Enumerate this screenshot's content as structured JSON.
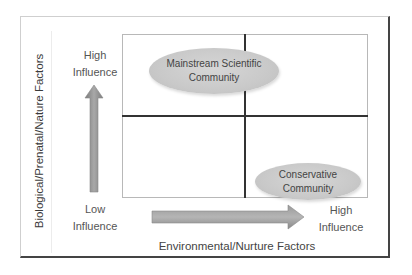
{
  "diagram": {
    "type": "2x2 quadrant matrix",
    "y_axis": {
      "title": "Biological/Prenatal/Nature Factors",
      "high_label": [
        "High",
        "Influence"
      ],
      "low_label": [
        "Low",
        "Influence"
      ]
    },
    "x_axis": {
      "title": "Environmental/Nurture Factors",
      "low_label": [
        "Low",
        "Influence"
      ],
      "high_label": [
        "High",
        "Influence"
      ]
    },
    "nodes": [
      {
        "label_lines": [
          "Mainstream Scientific",
          "Community"
        ],
        "quadrant": "top-left",
        "position": "high biological / low environmental"
      },
      {
        "label_lines": [
          "Conservative",
          "Community"
        ],
        "quadrant": "bottom-right",
        "position": "low biological / high environmental"
      }
    ],
    "colors": {
      "ellipse_fill": "#c9c9c9",
      "arrow_fill": "#8c8c8c",
      "grid_line": "#333333",
      "text": "#555555"
    }
  }
}
